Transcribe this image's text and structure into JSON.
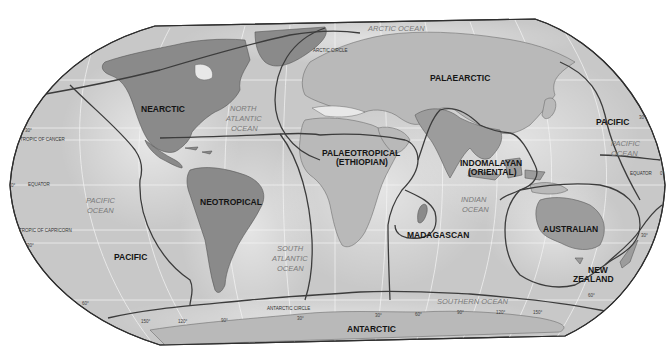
{
  "map": {
    "title": "Zoogeographic Realms of the World",
    "realms": [
      {
        "id": "nearctic",
        "label": "NEARCTIC"
      },
      {
        "id": "palaearctic",
        "label": "PALAEARCTIC"
      },
      {
        "id": "neotropical",
        "label": "NEOTROPICAL"
      },
      {
        "id": "palaeotropical",
        "label_line1": "PALAEOTROPICAL",
        "label_line2": "(ETHIOPIAN)"
      },
      {
        "id": "indomalayan",
        "label_line1": "INDOMALAYAN",
        "label_line2": "(ORIENTAL)"
      },
      {
        "id": "madagascan",
        "label": "MADAGASCAN"
      },
      {
        "id": "australian",
        "label": "AUSTRALIAN"
      },
      {
        "id": "new_zealand",
        "label_line1": "NEW",
        "label_line2": "ZEALAND"
      },
      {
        "id": "pacific_west",
        "label": "PACIFIC"
      },
      {
        "id": "pacific_east",
        "label": "PACIFIC"
      },
      {
        "id": "antarctic",
        "label": "ANTARCTIC"
      }
    ],
    "oceans": [
      {
        "id": "arctic",
        "label": "ARCTIC OCEAN"
      },
      {
        "id": "north_atlantic",
        "lines": [
          "NORTH",
          "ATLANTIC",
          "OCEAN"
        ]
      },
      {
        "id": "south_atlantic",
        "lines": [
          "SOUTH",
          "ATLANTIC",
          "OCEAN"
        ]
      },
      {
        "id": "pacific_west",
        "lines": [
          "PACIFIC",
          "OCEAN"
        ]
      },
      {
        "id": "pacific_east",
        "lines": [
          "PACIFIC",
          "OCEAN"
        ]
      },
      {
        "id": "indian",
        "lines": [
          "INDIAN",
          "OCEAN"
        ]
      },
      {
        "id": "southern",
        "label": "SOUTHERN OCEAN"
      }
    ],
    "reference_lines": {
      "arctic_circle": "ARCTIC CIRCLE",
      "tropic_of_cancer": "TROPIC OF CANCER",
      "equator_west": "EQUATOR",
      "equator_east": "EQUATOR",
      "tropic_of_capricorn": "TROPIC OF CAPRICORN",
      "antarctic_circle": "ANTARCTIC CIRCLE"
    },
    "latitude_ticks": {
      "north_30_west": "30°",
      "zero_west": "0°",
      "south_30_west": "30°",
      "south_60_west": "60°",
      "north_30_east": "30°",
      "zero_east": "0°",
      "south_30_east": "30°",
      "south_60_east": "60°"
    },
    "longitude_ticks": [
      "150°",
      "120°",
      "90°",
      "30°",
      "30°",
      "60°",
      "90°",
      "120°",
      "150°"
    ],
    "colors": {
      "ocean": "#c8c8c8",
      "land": "#b9b9b9",
      "nearctic_land": "#8a8a8a",
      "boundary": "#3c3c3c",
      "grid": "#f4f4f4"
    }
  }
}
